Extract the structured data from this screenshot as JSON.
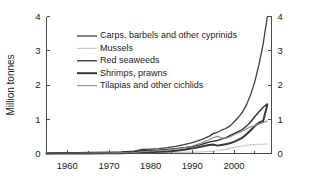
{
  "chart_data": {
    "type": "line",
    "title": "",
    "xlabel": "",
    "ylabel": "Million tonnes",
    "xlim": [
      1955,
      2009
    ],
    "ylim": [
      0,
      4
    ],
    "grid": false,
    "legend_position": "upper-left-inside",
    "y_ticks": [
      "0",
      "1",
      "2",
      "3",
      "4"
    ],
    "y_tick_values": [
      0,
      1,
      2,
      3,
      4
    ],
    "y_ticks_right": [
      "0",
      "1",
      "2",
      "3",
      "4"
    ],
    "x_ticks": [
      "1960",
      "1970",
      "1980",
      "1990",
      "2000"
    ],
    "x_tick_values": [
      1960,
      1970,
      1980,
      1990,
      2000
    ],
    "x_minor_tick_values": [
      1965,
      1975,
      1985,
      1995,
      2005
    ],
    "x": [
      1955,
      1960,
      1965,
      1970,
      1973,
      1976,
      1978,
      1980,
      1982,
      1984,
      1986,
      1988,
      1990,
      1992,
      1994,
      1995,
      1996,
      1997,
      1998,
      1999,
      2000,
      2001,
      2002,
      2003,
      2004,
      2005,
      2006,
      2007,
      2008
    ],
    "series": [
      {
        "name": "Carps, barbels and other cyprinids",
        "color": "#3d3d3d",
        "width": 1.3,
        "values": [
          0.01,
          0.02,
          0.03,
          0.04,
          0.05,
          0.07,
          0.12,
          0.13,
          0.14,
          0.17,
          0.21,
          0.26,
          0.32,
          0.4,
          0.5,
          0.58,
          0.62,
          0.68,
          0.73,
          0.8,
          0.92,
          1.05,
          1.2,
          1.42,
          1.72,
          2.1,
          2.6,
          3.2,
          4.0
        ]
      },
      {
        "name": "Mussels",
        "color": "#c8c8c8",
        "width": 1.2,
        "values": [
          0.0,
          0.0,
          0.0,
          0.01,
          0.01,
          0.01,
          0.01,
          0.02,
          0.02,
          0.02,
          0.03,
          0.03,
          0.04,
          0.05,
          0.06,
          0.07,
          0.08,
          0.1,
          0.12,
          0.15,
          0.18,
          0.2,
          0.22,
          0.24,
          0.25,
          0.26,
          0.27,
          0.27,
          0.28
        ]
      },
      {
        "name": "Red seaweeds",
        "color": "#2b2b2b",
        "width": 1.3,
        "values": [
          0.0,
          0.01,
          0.01,
          0.02,
          0.03,
          0.05,
          0.08,
          0.09,
          0.1,
          0.12,
          0.14,
          0.17,
          0.2,
          0.26,
          0.33,
          0.36,
          0.38,
          0.42,
          0.46,
          0.52,
          0.58,
          0.64,
          0.7,
          0.8,
          0.92,
          1.08,
          1.22,
          1.35,
          1.45
        ]
      },
      {
        "name": "Shrimps, prawns",
        "color": "#383838",
        "width": 2.0,
        "values": [
          0.0,
          0.0,
          0.0,
          0.01,
          0.01,
          0.02,
          0.03,
          0.04,
          0.05,
          0.06,
          0.08,
          0.11,
          0.15,
          0.2,
          0.25,
          0.26,
          0.23,
          0.25,
          0.27,
          0.3,
          0.34,
          0.4,
          0.46,
          0.56,
          0.68,
          0.8,
          0.9,
          0.95,
          1.42
        ]
      },
      {
        "name": "Tilapias and other cichlids",
        "color": "#8c8c8c",
        "width": 1.1,
        "values": [
          0.0,
          0.0,
          0.01,
          0.01,
          0.02,
          0.03,
          0.05,
          0.07,
          0.08,
          0.1,
          0.13,
          0.17,
          0.22,
          0.3,
          0.4,
          0.46,
          0.5,
          0.46,
          0.44,
          0.48,
          0.55,
          0.6,
          0.65,
          0.72,
          0.78,
          0.82,
          0.86,
          0.9,
          0.95
        ]
      }
    ]
  }
}
